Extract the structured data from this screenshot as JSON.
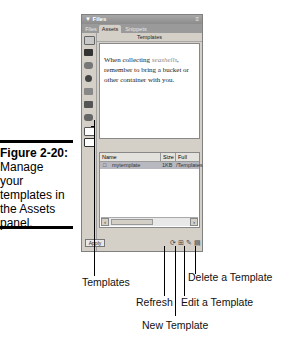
{
  "caption": {
    "figure": "Figure 2-20:",
    "text_lines": [
      "Manage",
      "your",
      "templates in",
      "the Assets",
      "panel."
    ]
  },
  "panel": {
    "title": "▼ Files",
    "options_icon": "options-menu-icon",
    "tabs": [
      {
        "label": "Files",
        "active": false
      },
      {
        "label": "Assets",
        "active": true
      },
      {
        "label": "Snippets",
        "active": false
      }
    ],
    "category_title": "Templates",
    "sidebar_icons": [
      "images-icon",
      "colors-icon",
      "urls-icon",
      "flash-icon",
      "shockwave-icon",
      "movies-icon",
      "scripts-icon",
      "templates-icon",
      "library-icon"
    ],
    "preview": {
      "before": "When collecting ",
      "emphasis": "seashells",
      "after": ", remember to bring a bucket or other container with you."
    },
    "list": {
      "columns": [
        "Name",
        "Size",
        "Full Path"
      ],
      "rows": [
        {
          "name": "mytemplate",
          "size": "1KB",
          "path": "/Templates"
        }
      ]
    },
    "apply_label": "Apply",
    "toolbar_icons": [
      "refresh-icon",
      "new-template-icon",
      "edit-template-icon",
      "delete-template-icon"
    ]
  },
  "callouts": {
    "templates": "Templates",
    "refresh": "Refresh",
    "new_template": "New Template",
    "edit_template": "Edit a Template",
    "delete_template": "Delete a Template"
  }
}
